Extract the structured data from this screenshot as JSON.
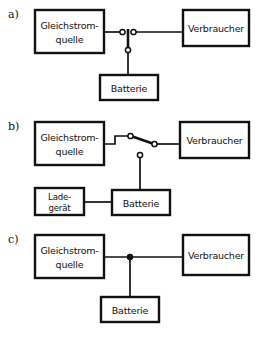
{
  "figure": {
    "type": "circuit-diagram-set"
  },
  "labels": {
    "a": "a)",
    "b": "b)",
    "c": "c)"
  },
  "blocks": {
    "source_line1": "Gleichstrom-",
    "source_line2": "quelle",
    "load": "Verbraucher",
    "battery": "Batterie",
    "charger_line1": "Lade-",
    "charger_line2": "gerät"
  },
  "panels": [
    {
      "id": "a",
      "label": "a)",
      "switch_type": "open-switch",
      "switch_state": "offen",
      "nodes": [
        "Gleichstromquelle",
        "Verbraucher",
        "Batterie"
      ],
      "terminals": 2
    },
    {
      "id": "b",
      "label": "b)",
      "switch_type": "changeover-switch",
      "switch_state": "auf Verbraucher geschaltet",
      "nodes": [
        "Gleichstromquelle",
        "Verbraucher",
        "Batterie",
        "Ladegerät"
      ],
      "terminals": 3
    },
    {
      "id": "c",
      "label": "c)",
      "switch_type": "solid-junction",
      "switch_state": "fest verbunden",
      "nodes": [
        "Gleichstromquelle",
        "Verbraucher",
        "Batterie"
      ],
      "terminals": 1
    }
  ],
  "colors": {
    "line": "#111111",
    "background": "#ffffff"
  }
}
